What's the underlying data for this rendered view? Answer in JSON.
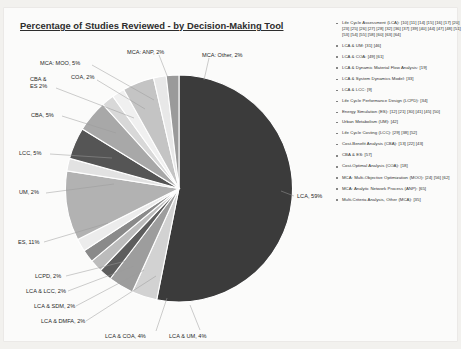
{
  "title": "Percentage of Studies Reviewed - by Decision-Making Tool",
  "chart_data": {
    "type": "pie",
    "title": "Percentage of Studies Reviewed - by Decision-Making Tool",
    "xlabel": "",
    "ylabel": "",
    "legend_position": "right",
    "grid": false,
    "value_suffix": "%",
    "categories": [
      "LCA",
      "LCA & UM",
      "LCA & COA",
      "LCA & DMFA",
      "LCA & SDM",
      "LCA & LCC",
      "LCPD",
      "ES",
      "UM",
      "LCC",
      "CBA",
      "CBA & ES",
      "COA",
      "MCA: MOO",
      "MCA: ANP",
      "MCA: Other"
    ],
    "values": [
      59,
      4,
      4,
      2,
      2,
      2,
      2,
      11,
      2,
      5,
      5,
      2,
      2,
      5,
      2,
      2
    ],
    "colors": [
      "#3b3b3b",
      "#d2d2d2",
      "#9d9d9d",
      "#5d5d5d",
      "#bcbcbc",
      "#8a8a8a",
      "#ececec",
      "#b2b2b2",
      "#e2e2e2",
      "#555555",
      "#a8a8a8",
      "#d8d8d8",
      "#f0f0f0",
      "#c4c4c4",
      "#e8e8e8",
      "#9a9a9a"
    ],
    "slice_labels": [
      "LCA, 59%",
      "LCA & UM, 4%",
      "LCA & COA, 4%",
      "LCA & DMFA, 2%",
      "LCA & SDM, 2%",
      "LCA & LCC, 2%",
      "LCPD, 2%",
      "ES, 11%",
      "UM, 2%",
      "LCC, 5%",
      "CBA, 5%",
      "CBA & ES 2%",
      "COA, 2%",
      "MCA: MOO, 5%",
      "MCA: ANP, 2%",
      "MCA: Other, 2%"
    ]
  },
  "legend": {
    "items": [
      "Life Cycle Assessment (LCA): [10] [11] [14] [15] [16] [17] [20] [23] [25] [26] [27] [28] [32] [36] [37] [39] [40] [44] [47] [48] [51] [53] [54] [55] [58] [60] [63] [64]",
      "LCA & UM: [31] [46]",
      "LCA & COA: [49] [61]",
      "LCA & Dynamic Material Flow Analysis: [19]",
      "LCA & System Dynamics Model: [33]",
      "LCA & LCC: [9]",
      "Life Cycle Performance Design (LCPD): [34]",
      "Energy Simulation (ES): [12] [21] [30] [41] [45] [50]",
      "Urban Metabolism (UM): [42]",
      "Life Cycle Costing (LCC): [29] [38] [52]",
      "Cost-Benefit Analysis (CBA): [13] [22] [43]",
      "CBA & ES: [57]",
      "Cost-Optimal Analysis (COA): [18]",
      "MCA: Multi-Objective Optimization (MOO): [24] [56] [62]",
      "MCA: Analytic Network Process (ANP): [65]",
      "Multi-Criteria Analysis, Other (MCA): [35]"
    ]
  }
}
